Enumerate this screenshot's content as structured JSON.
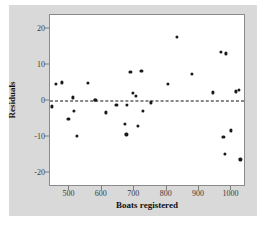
{
  "figure": {
    "background_color": "#ffffff",
    "panel_color": "#d9d9d9",
    "plot_background_color": "#ffffff",
    "point_color": "#1a1a1a",
    "reference_line_color": "#111111"
  },
  "chart_data": {
    "type": "scatter",
    "title": "",
    "xlabel": "Boats registered",
    "ylabel": "Residuals",
    "xlim": [
      440,
      1045
    ],
    "ylim": [
      -24,
      24
    ],
    "xticks": [
      500,
      600,
      700,
      800,
      900,
      1000
    ],
    "xtick_labels": [
      "500",
      "600",
      "700",
      "800",
      "900",
      "1000"
    ],
    "yticks": [
      20,
      10,
      0,
      -10,
      -20
    ],
    "ytick_labels": [
      "20",
      "10",
      "0",
      "-10",
      "-20"
    ],
    "grid": false,
    "legend": null,
    "reference_line": {
      "orientation": "horizontal",
      "y": 0,
      "style": "dashed"
    },
    "points": [
      {
        "x": 447,
        "y": -1.5
      },
      {
        "x": 459,
        "y": 4.8
      },
      {
        "x": 478,
        "y": 5.2
      },
      {
        "x": 497,
        "y": -5.0
      },
      {
        "x": 511,
        "y": 1.0
      },
      {
        "x": 513,
        "y": -2.8
      },
      {
        "x": 523,
        "y": -9.7
      },
      {
        "x": 557,
        "y": 5.0
      },
      {
        "x": 578,
        "y": 0.4
      },
      {
        "x": 580,
        "y": 0.2
      },
      {
        "x": 612,
        "y": -3.2
      },
      {
        "x": 645,
        "y": -1.1
      },
      {
        "x": 672,
        "y": -6.5
      },
      {
        "x": 676,
        "y": -9.3
      },
      {
        "x": 678,
        "y": -1.1
      },
      {
        "x": 688,
        "y": 8.2
      },
      {
        "x": 697,
        "y": 2.3
      },
      {
        "x": 706,
        "y": 1.4
      },
      {
        "x": 712,
        "y": -7.0
      },
      {
        "x": 722,
        "y": 8.5
      },
      {
        "x": 727,
        "y": -2.7
      },
      {
        "x": 752,
        "y": -0.4
      },
      {
        "x": 803,
        "y": 4.8
      },
      {
        "x": 831,
        "y": 17.8
      },
      {
        "x": 877,
        "y": 7.5
      },
      {
        "x": 943,
        "y": 2.4
      },
      {
        "x": 968,
        "y": 13.8
      },
      {
        "x": 975,
        "y": -10.1
      },
      {
        "x": 980,
        "y": -14.8
      },
      {
        "x": 983,
        "y": 13.3
      },
      {
        "x": 998,
        "y": -8.2
      },
      {
        "x": 1013,
        "y": 2.7
      },
      {
        "x": 1023,
        "y": 3.1
      },
      {
        "x": 1028,
        "y": -16.3
      }
    ]
  }
}
